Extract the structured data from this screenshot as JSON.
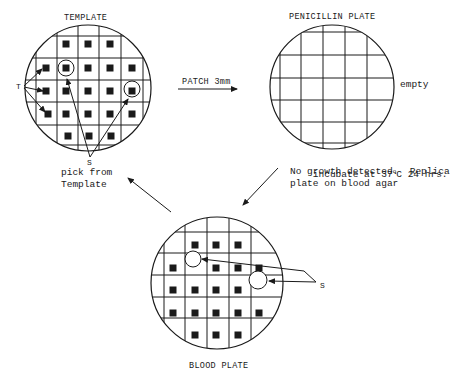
{
  "labels": {
    "template_title": "TEMPLATE",
    "penicillin_title": "PENICILLIN PLATE",
    "blood_title": "BLOOD PLATE",
    "patch": "PATCH 3mm",
    "empty": "empty",
    "t_label": "T",
    "s_template": "S",
    "pick_line1": "pick from",
    "pick_line2": "Template",
    "s_blood": "S",
    "incubate_pre": "incubate at 37",
    "incubate_deg": "o",
    "incubate_post": "C 24 hrs.",
    "incubate_line2": "No growth detected.  Replica",
    "incubate_line3": "plate on blood agar"
  },
  "colors": {
    "ink": "#1a1a1a",
    "background": "#ffffff"
  },
  "plates": {
    "template": {
      "cx": 88,
      "cy": 88,
      "r": 63,
      "vlines": [
        36,
        57,
        78,
        99,
        121,
        143
      ],
      "hlines": [
        36,
        58,
        80,
        102,
        125,
        145
      ],
      "colonies": [
        [
          66,
          44
        ],
        [
          88,
          44
        ],
        [
          110,
          44
        ],
        [
          46,
          68
        ],
        [
          66,
          68
        ],
        [
          88,
          68
        ],
        [
          110,
          68
        ],
        [
          132,
          68
        ],
        [
          46,
          91
        ],
        [
          66,
          91
        ],
        [
          88,
          91
        ],
        [
          110,
          91
        ],
        [
          132,
          91
        ],
        [
          48,
          114
        ],
        [
          66,
          114
        ],
        [
          88,
          114
        ],
        [
          110,
          114
        ],
        [
          132,
          114
        ],
        [
          68,
          136
        ],
        [
          89,
          136
        ],
        [
          111,
          136
        ]
      ],
      "circled": [
        [
          66,
          68
        ],
        [
          132,
          89
        ]
      ]
    },
    "penicillin": {
      "cx": 332,
      "cy": 87,
      "r": 62,
      "vlines": [
        280,
        301,
        323,
        345,
        367
      ],
      "hlines": [
        32,
        55,
        78,
        100,
        122,
        143
      ],
      "colonies": [],
      "circled": []
    },
    "blood": {
      "cx": 217,
      "cy": 283,
      "r": 66,
      "vlines": [
        164,
        185,
        207,
        229,
        251
      ],
      "hlines": [
        232,
        253,
        275,
        297,
        318
      ],
      "colonies": [
        [
          195,
          245
        ],
        [
          216,
          245
        ],
        [
          238,
          245
        ],
        [
          173,
          268
        ],
        [
          216,
          268
        ],
        [
          238,
          268
        ],
        [
          259,
          268
        ],
        [
          173,
          290
        ],
        [
          195,
          290
        ],
        [
          216,
          290
        ],
        [
          238,
          290
        ],
        [
          173,
          313
        ],
        [
          195,
          313
        ],
        [
          216,
          313
        ],
        [
          238,
          313
        ],
        [
          259,
          313
        ],
        [
          195,
          335
        ],
        [
          216,
          335
        ],
        [
          238,
          335
        ]
      ],
      "empty_circles": [
        [
          193,
          259,
          8
        ],
        [
          258,
          280,
          9
        ]
      ]
    }
  }
}
